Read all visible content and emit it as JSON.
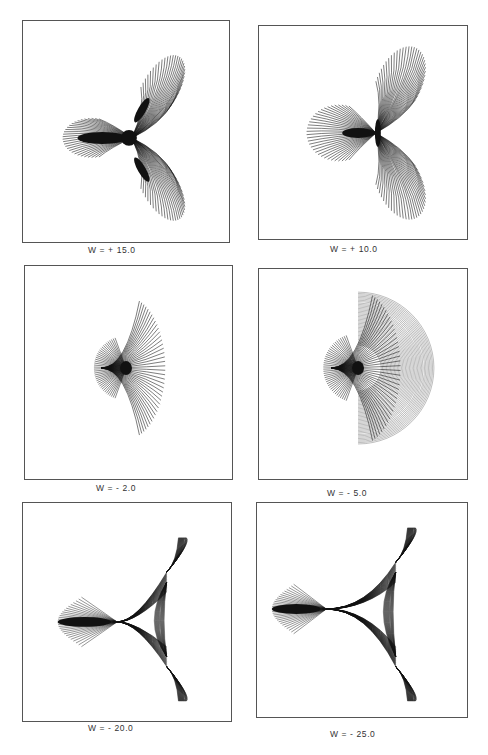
{
  "figure": {
    "panels": [
      {
        "id": "p1",
        "label": "W = + 15.0",
        "w": 15.0,
        "kind": "trefoil"
      },
      {
        "id": "p2",
        "label": "W = + 10.0",
        "w": 10.0,
        "kind": "trefoil"
      },
      {
        "id": "p3",
        "label": "W = - 2.0",
        "w": -2.0,
        "kind": "fan"
      },
      {
        "id": "p4",
        "label": "W = - 5.0",
        "w": -5.0,
        "kind": "fan"
      },
      {
        "id": "p5",
        "label": "W = - 20.0",
        "w": -20.0,
        "kind": "cusp"
      },
      {
        "id": "p6",
        "label": "W = - 25.0",
        "w": -25.0,
        "kind": "cusp"
      }
    ],
    "line_color": "#111111",
    "frame_color": "#555555"
  }
}
